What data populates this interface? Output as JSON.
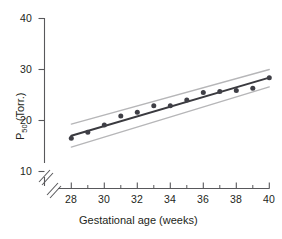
{
  "chart_data": {
    "type": "scatter",
    "title": "",
    "xlabel": "Gestational age (weeks)",
    "ylabel": "P50 (Torr.)",
    "ylabel_base": "P",
    "ylabel_sub": "50",
    "ylabel_rest": " (Torr.)",
    "xlim": [
      27.3,
      40.6
    ],
    "ylim": [
      8.6,
      41.0
    ],
    "xticks": [
      28,
      30,
      32,
      34,
      36,
      38,
      40
    ],
    "xtick_labels": [
      "28",
      "30",
      "32",
      "34",
      "36",
      "38",
      "40"
    ],
    "xminorticks": [
      29,
      31,
      33,
      35,
      37,
      39
    ],
    "yticks": [
      10,
      20,
      30,
      40
    ],
    "ytick_labels": [
      "10",
      "20",
      "30",
      "40"
    ],
    "grid": false,
    "legend": "none",
    "axis_break": true,
    "axis_break_note": "broken axis (double slash) near origin on both x and y axes",
    "x": [
      28,
      29,
      30,
      31,
      32,
      33,
      34,
      35,
      36,
      37,
      38,
      39,
      40
    ],
    "values": [
      16.5,
      17.7,
      19.1,
      20.9,
      21.6,
      22.9,
      22.9,
      24.0,
      25.5,
      25.7,
      25.9,
      26.3,
      28.4
    ],
    "series": [
      {
        "name": "P50 observations",
        "style": "markers",
        "color": "#3f3f46",
        "values": [
          16.5,
          17.7,
          19.1,
          20.9,
          21.6,
          22.9,
          22.9,
          24.0,
          25.5,
          25.7,
          25.9,
          26.3,
          28.4
        ]
      },
      {
        "name": "regression line",
        "style": "line",
        "color": "#3a3a3f",
        "x": [
          28,
          40
        ],
        "values": [
          17.0,
          28.4
        ]
      },
      {
        "name": "upper confidence band",
        "style": "line",
        "color": "#b6b6b8",
        "x": [
          28,
          40
        ],
        "values": [
          19.3,
          30.0
        ]
      },
      {
        "name": "lower confidence band",
        "style": "line",
        "color": "#b6b6b8",
        "x": [
          28,
          40
        ],
        "values": [
          14.8,
          26.6
        ]
      }
    ]
  },
  "colors": {
    "axis": "#58585b",
    "marker": "#3f3f46",
    "fit_line": "#3a3a3f",
    "band": "#b6b6b8",
    "text": "#231f20",
    "background": "#ffffff"
  }
}
